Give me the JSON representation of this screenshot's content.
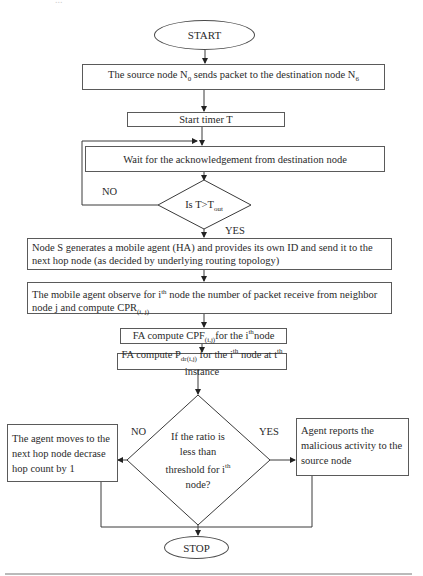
{
  "diagram": {
    "type": "flowchart",
    "top_fragment": "...",
    "start": {
      "label": "START"
    },
    "stop": {
      "label": "STOP"
    },
    "steps": {
      "send_packet": {
        "text": "The source node N",
        "sub1": "0",
        "text2": " sends packet to the destination node N",
        "sub2": "6"
      },
      "start_timer": {
        "text": "Start timer T"
      },
      "wait_ack": {
        "text": "Wait for the acknowledgement from destination node"
      },
      "generate_agent": {
        "text": "Node S generates a mobile agent (HA) and provides its own ID and send it to the next hop node (as decided by underlying routing topology)"
      },
      "observe": {
        "text1": "The mobile agent observe for i",
        "sup": "th",
        "text2": " node the number of packet receive from neighbor node j and compute CPR",
        "sub": "(i, j)"
      },
      "compute_cpf": {
        "text1": "FA compute CPF",
        "sub": "(i,j)",
        "text2": "for the i",
        "sup": "th",
        "text3": "node"
      },
      "compute_pdr": {
        "text1": "FA compute P",
        "sub": "dr(i,j)",
        "text2": " for the i",
        "sup1": "th",
        "text3": " node at t",
        "sup2": "th",
        "text4": " instance"
      },
      "move_next": {
        "text": "The agent moves to the next hop node decrase hop count by 1"
      },
      "report": {
        "text": "Agent reports the malicious activity to the source node"
      }
    },
    "decisions": {
      "timeout": {
        "text": "Is T>T",
        "sub": "out",
        "no_label": "NO",
        "yes_label": "YES"
      },
      "threshold": {
        "line1": "If the ratio is",
        "line2": "less than",
        "line3": "threshold for i",
        "sup": "th",
        "line4": "node?",
        "no_label": "NO",
        "yes_label": "YES"
      }
    },
    "colors": {
      "line": "#3a3a3a",
      "text": "#2a2a2a",
      "background": "#ffffff"
    }
  }
}
